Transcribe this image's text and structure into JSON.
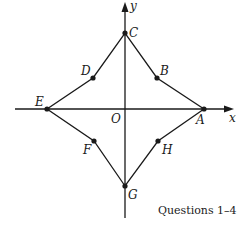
{
  "diagram": {
    "axes": {
      "x_label": "x",
      "y_label": "y",
      "origin_label": "O"
    },
    "points": [
      {
        "name": "A",
        "label": "A"
      },
      {
        "name": "B",
        "label": "B"
      },
      {
        "name": "C",
        "label": "C"
      },
      {
        "name": "D",
        "label": "D"
      },
      {
        "name": "E",
        "label": "E"
      },
      {
        "name": "F",
        "label": "F"
      },
      {
        "name": "G",
        "label": "G"
      },
      {
        "name": "H",
        "label": "H"
      }
    ],
    "path_order": [
      "A",
      "B",
      "C",
      "D",
      "E",
      "F",
      "G",
      "H",
      "A"
    ],
    "caption": "Questions 1–4"
  },
  "colors": {
    "stroke": "#1a1a1a",
    "background": "#ffffff"
  }
}
